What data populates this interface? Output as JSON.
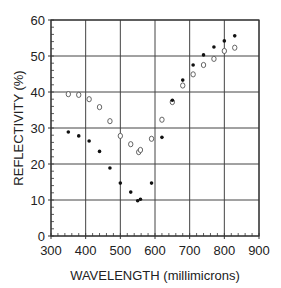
{
  "chart_data": {
    "type": "scatter",
    "title": "",
    "xlabel": "WAVELENGTH (millimicrons)",
    "ylabel": "REFLECTIVITY (%)",
    "xlim": [
      300,
      900
    ],
    "ylim": [
      0,
      60
    ],
    "x_ticks": [
      300,
      400,
      500,
      600,
      700,
      800,
      900
    ],
    "y_ticks": [
      0,
      10,
      20,
      30,
      40,
      50,
      60
    ],
    "x_minor_step": 20,
    "y_minor_step": 2,
    "grid": true,
    "legend": null,
    "series": [
      {
        "name": "open-circles",
        "marker": "open-circle",
        "color": "#555555",
        "points": [
          [
            350,
            39.4
          ],
          [
            380,
            39.2
          ],
          [
            410,
            38.0
          ],
          [
            440,
            35.8
          ],
          [
            470,
            31.9
          ],
          [
            500,
            27.8
          ],
          [
            530,
            25.5
          ],
          [
            553,
            23.3
          ],
          [
            558,
            23.9
          ],
          [
            590,
            27.0
          ],
          [
            620,
            32.3
          ],
          [
            650,
            37.2
          ],
          [
            680,
            41.8
          ],
          [
            710,
            44.9
          ],
          [
            740,
            47.5
          ],
          [
            770,
            49.2
          ],
          [
            800,
            51.4
          ],
          [
            830,
            52.3
          ]
        ]
      },
      {
        "name": "filled-dots",
        "marker": "filled-dot",
        "color": "#111111",
        "points": [
          [
            350,
            28.9
          ],
          [
            380,
            27.8
          ],
          [
            410,
            26.4
          ],
          [
            440,
            23.5
          ],
          [
            470,
            18.9
          ],
          [
            500,
            14.7
          ],
          [
            530,
            12.2
          ],
          [
            550,
            9.8
          ],
          [
            558,
            10.2
          ],
          [
            590,
            14.7
          ],
          [
            620,
            27.4
          ],
          [
            650,
            37.7
          ],
          [
            680,
            43.3
          ],
          [
            710,
            47.5
          ],
          [
            740,
            50.3
          ],
          [
            770,
            52.5
          ],
          [
            800,
            54.2
          ],
          [
            830,
            55.6
          ]
        ]
      }
    ]
  }
}
